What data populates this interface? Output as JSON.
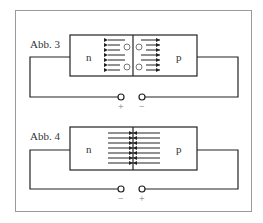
{
  "figures": [
    {
      "label": "Abb. 3",
      "left_region": "n",
      "right_region": "p",
      "left_terminal": "+",
      "right_terminal": "−",
      "description": "reverse bias: carriers drift away from junction, depletion zone with ions"
    },
    {
      "label": "Abb. 4",
      "left_region": "n",
      "right_region": "p",
      "left_terminal": "−",
      "right_terminal": "+",
      "description": "forward bias: carriers flow across junction"
    }
  ],
  "colors": {
    "line": "#222222",
    "frame": "#9a9a9a",
    "text": "#333333"
  }
}
